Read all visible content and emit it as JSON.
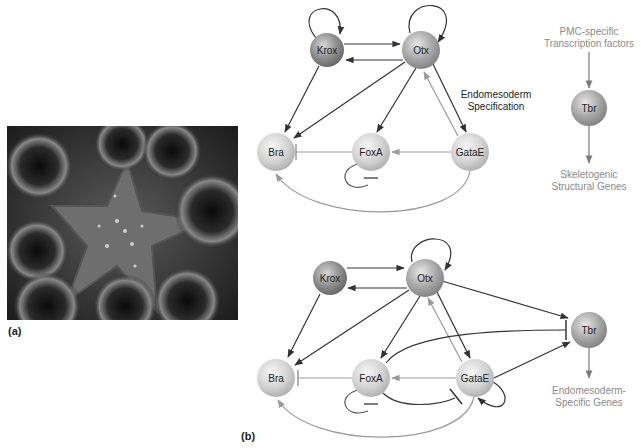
{
  "panels": {
    "a": {
      "label": "(a)",
      "photo_description": "sea star surrounded by sea urchins"
    },
    "b": {
      "label": "(b)"
    }
  },
  "top_network": {
    "nodes": {
      "krox": "Krox",
      "otx": "Otx",
      "bra": "Bra",
      "foxa": "FoxA",
      "gatae": "GataE",
      "tbr": "Tbr"
    },
    "annotation_line1": "Endomesoderm",
    "annotation_line2": "Specification",
    "pmc_line1": "PMC-specific",
    "pmc_line2": "Transcription factors",
    "output_line1": "Skeletogenic",
    "output_line2": "Structural Genes"
  },
  "bottom_network": {
    "nodes": {
      "krox": "Krox",
      "otx": "Otx",
      "bra": "Bra",
      "foxa": "FoxA",
      "gatae": "GataE",
      "tbr": "Tbr"
    },
    "output_line1": "Endomesoderm-",
    "output_line2": "Specific Genes"
  },
  "colors": {
    "dark_edge": "#333333",
    "light_edge": "#9a9a9a",
    "label_gray": "#8a8a8a",
    "node_dark": "#8c8c8c",
    "node_light": "#d4d4d4"
  }
}
